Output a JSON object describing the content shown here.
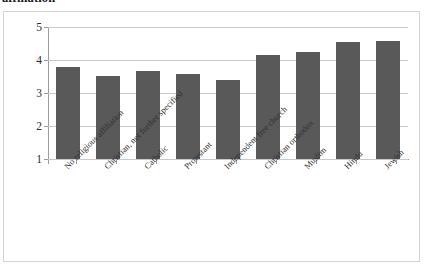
{
  "document": {
    "heading_fragment": "affiliation"
  },
  "chart_data": {
    "type": "bar",
    "title": "",
    "xlabel": "",
    "ylabel": "",
    "ylim": [
      1,
      5
    ],
    "yticks": [
      1,
      2,
      3,
      4,
      5
    ],
    "ytick_labels": [
      "1",
      "2",
      "3",
      "4",
      "5"
    ],
    "grid": true,
    "legend": false,
    "legend_position": "none",
    "bar_color": "#595959",
    "gridline_color": "#c9c9c9",
    "axis_color": "#9b9b9b",
    "frame_color": "#d4d4d4",
    "background": "#ffffff",
    "categories": [
      "No religious affiliation",
      "Christian, not further specified",
      "Catholic",
      "Protestant",
      "Independent free church",
      "Christian orthodox",
      "Muslim",
      "Hindu",
      "Jewish"
    ],
    "values": [
      3.78,
      3.52,
      3.67,
      3.57,
      3.38,
      4.15,
      4.25,
      4.55,
      4.58
    ]
  }
}
